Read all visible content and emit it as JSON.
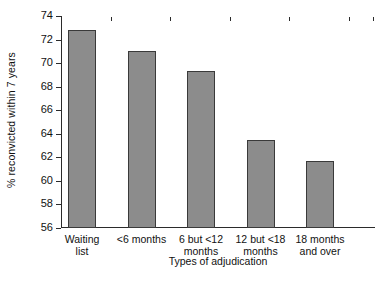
{
  "chart_data": {
    "type": "bar",
    "title": "",
    "xlabel": "Types of adjudication",
    "ylabel": "% reconvicted within 7 years",
    "categories": [
      "Waiting list",
      "<6 months",
      "6 but <12 months",
      "12 but <18 months",
      "18 months and over"
    ],
    "category_lines": [
      [
        "Waiting",
        "list"
      ],
      [
        "<6 months"
      ],
      [
        "6 but <12",
        "months"
      ],
      [
        "12 but <18",
        "months"
      ],
      [
        "18 months",
        "and over"
      ]
    ],
    "values": [
      72.8,
      71.0,
      69.3,
      63.5,
      61.7
    ],
    "ylim": [
      56,
      74
    ],
    "ytick_step": 2,
    "ytick_labels": [
      "74",
      "72",
      "70",
      "68",
      "66",
      "64",
      "62",
      "60",
      "58",
      "56"
    ],
    "ytick_values": [
      74,
      72,
      70,
      68,
      66,
      64,
      62,
      60,
      58,
      56
    ],
    "grid": false,
    "legend": "none",
    "bar_color": "#8c8c8c",
    "bar_edge_color": "#3a3a3a",
    "axis_color": "#2b2b2b",
    "background": "#ffffff"
  }
}
